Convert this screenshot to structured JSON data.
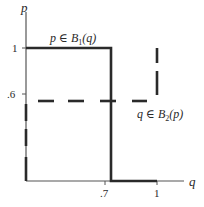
{
  "diagram": {
    "type": "best-response-diagram",
    "axes": {
      "x_label": "q",
      "y_label": "p",
      "x_ticks": [
        ".7",
        "1"
      ],
      "y_ticks": [
        "1",
        ".6"
      ]
    },
    "curves": {
      "player1": {
        "label_var": "p",
        "label_in": "∈",
        "label_fn": "B",
        "label_sub": "1",
        "label_arg": "(q)",
        "style": "solid-thick"
      },
      "player2": {
        "label_var": "q",
        "label_in": "∈",
        "label_fn": "B",
        "label_sub": "2",
        "label_arg": "(p)",
        "style": "dashed-thick"
      }
    },
    "colors": {
      "line": "#2a2a2a",
      "axis": "#555555",
      "background": "#ffffff"
    }
  }
}
